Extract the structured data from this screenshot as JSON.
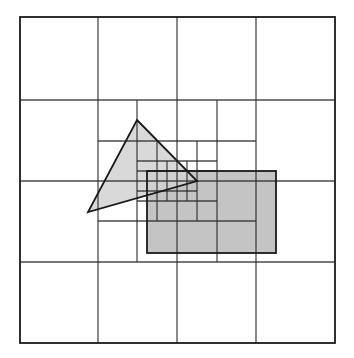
{
  "diagram": {
    "title": "",
    "kind": "quadtree-spatial-subdivision",
    "colors": {
      "background": "#ffffff",
      "grid_line": "#2a2a2a",
      "outer_border": "#1a1a1a",
      "triangle_fill": "#d2d2d2",
      "rectangle_fill": "#c4c4c4",
      "shape_stroke": "#1a1a1a"
    },
    "outer_box": {
      "x": 20,
      "y": 17,
      "w": 315,
      "h": 326
    },
    "levels": [
      {
        "level": 1,
        "vertical": [
          {
            "x": 98,
            "y1": 17,
            "y2": 343
          },
          {
            "x": 177,
            "y1": 17,
            "y2": 343
          },
          {
            "x": 256,
            "y1": 17,
            "y2": 343
          }
        ],
        "horizontal": [
          {
            "y": 100,
            "x1": 20,
            "x2": 335
          },
          {
            "y": 181,
            "x1": 20,
            "x2": 335
          },
          {
            "y": 262,
            "x1": 20,
            "x2": 335
          }
        ]
      },
      {
        "level": 2,
        "vertical": [
          {
            "x": 137,
            "y1": 100,
            "y2": 262
          },
          {
            "x": 217,
            "y1": 100,
            "y2": 262
          }
        ],
        "horizontal": [
          {
            "y": 141,
            "x1": 98,
            "x2": 256
          },
          {
            "y": 221,
            "x1": 98,
            "x2": 256
          }
        ]
      },
      {
        "level": 3,
        "vertical": [
          {
            "x": 157,
            "y1": 141,
            "y2": 221
          },
          {
            "x": 197,
            "y1": 141,
            "y2": 221
          }
        ],
        "horizontal": [
          {
            "y": 161,
            "x1": 137,
            "x2": 217
          },
          {
            "y": 201,
            "x1": 137,
            "x2": 217
          }
        ]
      },
      {
        "level": 4,
        "vertical": [
          {
            "x": 167,
            "y1": 161,
            "y2": 201
          },
          {
            "x": 187,
            "y1": 161,
            "y2": 201
          }
        ],
        "horizontal": [
          {
            "y": 171,
            "x1": 137,
            "x2": 217
          },
          {
            "y": 191,
            "x1": 137,
            "x2": 197
          }
        ]
      }
    ],
    "shapes": {
      "triangle": {
        "points": [
          [
            137,
            120
          ],
          [
            197,
            181
          ],
          [
            88,
            212
          ]
        ]
      },
      "rectangle": {
        "x": 147,
        "y": 171,
        "w": 129,
        "h": 82
      }
    }
  }
}
